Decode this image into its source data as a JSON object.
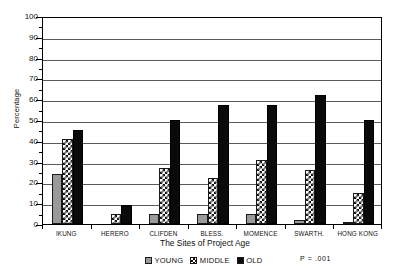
{
  "chart_data": {
    "type": "bar",
    "title": "",
    "xlabel": "The Sites of Project Age",
    "ylabel": "Percentage",
    "ylim": [
      0,
      100
    ],
    "ytick_step": 10,
    "ytick_labels": [
      "100",
      "90",
      "80",
      "70",
      "60",
      "50",
      "40",
      "30",
      "20",
      "10",
      "0"
    ],
    "grid": true,
    "legend_position": "bottom-center",
    "categories": [
      "IKUNG",
      "HERERO",
      "CLIFDEN",
      "BLESS.",
      "MOMENCE",
      "SWARTH.",
      "HONG KONG"
    ],
    "series": [
      {
        "name": "YOUNG",
        "values": [
          24,
          0,
          5,
          5,
          5,
          2,
          1
        ]
      },
      {
        "name": "MIDDLE",
        "values": [
          41,
          5,
          27,
          22,
          31,
          26,
          15
        ]
      },
      {
        "name": "OLD",
        "values": [
          45,
          9,
          50,
          57,
          57,
          62,
          50
        ]
      }
    ],
    "annotation": "P = .001"
  },
  "legend": {
    "entries": [
      {
        "label": "YOUNG",
        "swatch": "gray-solid-swatch"
      },
      {
        "label": "MIDDLE",
        "swatch": "crosshatch-swatch"
      },
      {
        "label": "OLD",
        "swatch": "black-solid-swatch"
      }
    ]
  },
  "colors": {
    "young": "#999999",
    "middle": "#ffffff",
    "old": "#0a0a0a",
    "axis": "#000000",
    "gridline": "#5a5a5a"
  }
}
